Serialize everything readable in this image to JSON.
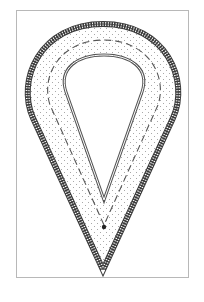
{
  "diagram": {
    "type": "teardrop-plan-drawing",
    "colors": {
      "frame": "#b8b8b8",
      "outer_hatch": "#3a3a3a",
      "stipple": "#9a9a9a",
      "dashed_line": "#555555",
      "inner_line": "#555555",
      "center_dot": "#222222"
    }
  }
}
